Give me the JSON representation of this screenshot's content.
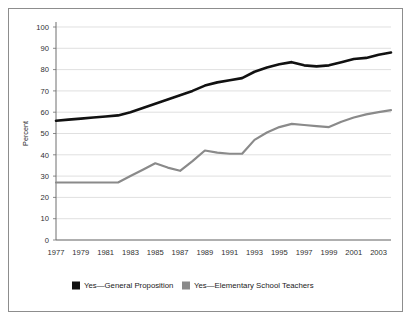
{
  "chart_data": {
    "type": "line",
    "title": "",
    "xlabel": "",
    "ylabel": "Percent",
    "ylim": [
      0,
      100
    ],
    "ytick_values": [
      0,
      10,
      20,
      30,
      40,
      50,
      60,
      70,
      80,
      90,
      100
    ],
    "ytick_labels": [
      "0",
      "10",
      "20",
      "30",
      "40",
      "50",
      "60",
      "70",
      "80",
      "90",
      "100"
    ],
    "xlim": [
      1977,
      2004
    ],
    "xtick_labels": [
      "1977",
      "1979",
      "1981",
      "1983",
      "1985",
      "1987",
      "1989",
      "1991",
      "1993",
      "1995",
      "1997",
      "1999",
      "2001",
      "2003"
    ],
    "xtick_values": [
      1977,
      1979,
      1981,
      1983,
      1985,
      1987,
      1989,
      1991,
      1993,
      1995,
      1997,
      1999,
      2001,
      2003
    ],
    "grid": "horizontal",
    "legend_position": "bottom",
    "x": [
      1977,
      1978,
      1979,
      1980,
      1981,
      1982,
      1983,
      1984,
      1985,
      1986,
      1987,
      1988,
      1989,
      1990,
      1991,
      1992,
      1993,
      1994,
      1995,
      1996,
      1997,
      1998,
      1999,
      2000,
      2001,
      2002,
      2003,
      2004
    ],
    "series": [
      {
        "name": "Yes—General Proposition",
        "color": "#111111",
        "width": 2.6,
        "values": [
          56,
          56.5,
          57,
          57.5,
          58,
          58.5,
          60,
          62,
          64,
          66,
          68,
          70,
          72.5,
          74,
          75,
          76,
          79,
          81,
          82.5,
          83.5,
          82,
          81.5,
          82,
          83.5,
          85,
          85.5,
          87,
          88
        ]
      },
      {
        "name": "Yes—Elementary School Teachers",
        "color": "#8a8a8a",
        "width": 2.2,
        "values": [
          27,
          27,
          27,
          27,
          27,
          27,
          30,
          33,
          36,
          34,
          32.5,
          37,
          42,
          41,
          40.5,
          40.5,
          47,
          50.5,
          53,
          54.5,
          54,
          53.5,
          53,
          55.5,
          57.5,
          59,
          60,
          61
        ]
      }
    ],
    "legend": [
      {
        "label": "Yes—General Proposition",
        "color": "#111111",
        "marker": "square-swatch"
      },
      {
        "label": "Yes—Elementary School Teachers",
        "color": "#8a8a8a",
        "marker": "square-swatch"
      }
    ]
  }
}
